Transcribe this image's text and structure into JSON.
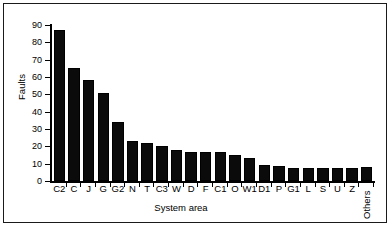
{
  "chart_data": {
    "type": "bar",
    "title": "",
    "xlabel": "System area",
    "ylabel": "Faults",
    "ylim": [
      0,
      90
    ],
    "yticks": [
      0,
      10,
      20,
      30,
      40,
      50,
      60,
      70,
      80,
      90
    ],
    "ytick_labels": [
      "0",
      "10",
      "20",
      "30",
      "40",
      "50",
      "60",
      "70",
      "80",
      "90"
    ],
    "grid": false,
    "legend": null,
    "bar_color": "#0b0b0b",
    "categories": [
      "C2",
      "C",
      "J",
      "G",
      "G2",
      "N",
      "T",
      "C3",
      "W",
      "D",
      "F",
      "C1",
      "O",
      "W1",
      "D1",
      "P",
      "G1",
      "L",
      "S",
      "U",
      "Z",
      "Others"
    ],
    "values": [
      87,
      65,
      58,
      50.5,
      34,
      23,
      22,
      20,
      18,
      17,
      16.5,
      16.5,
      15,
      13,
      9.5,
      8.5,
      7.5,
      7.5,
      7.5,
      7.5,
      7.5,
      8
    ],
    "rotated_labels": [
      "Others"
    ]
  },
  "figure": {
    "background": "#ffffff",
    "border_color": "#1a1a1a"
  }
}
